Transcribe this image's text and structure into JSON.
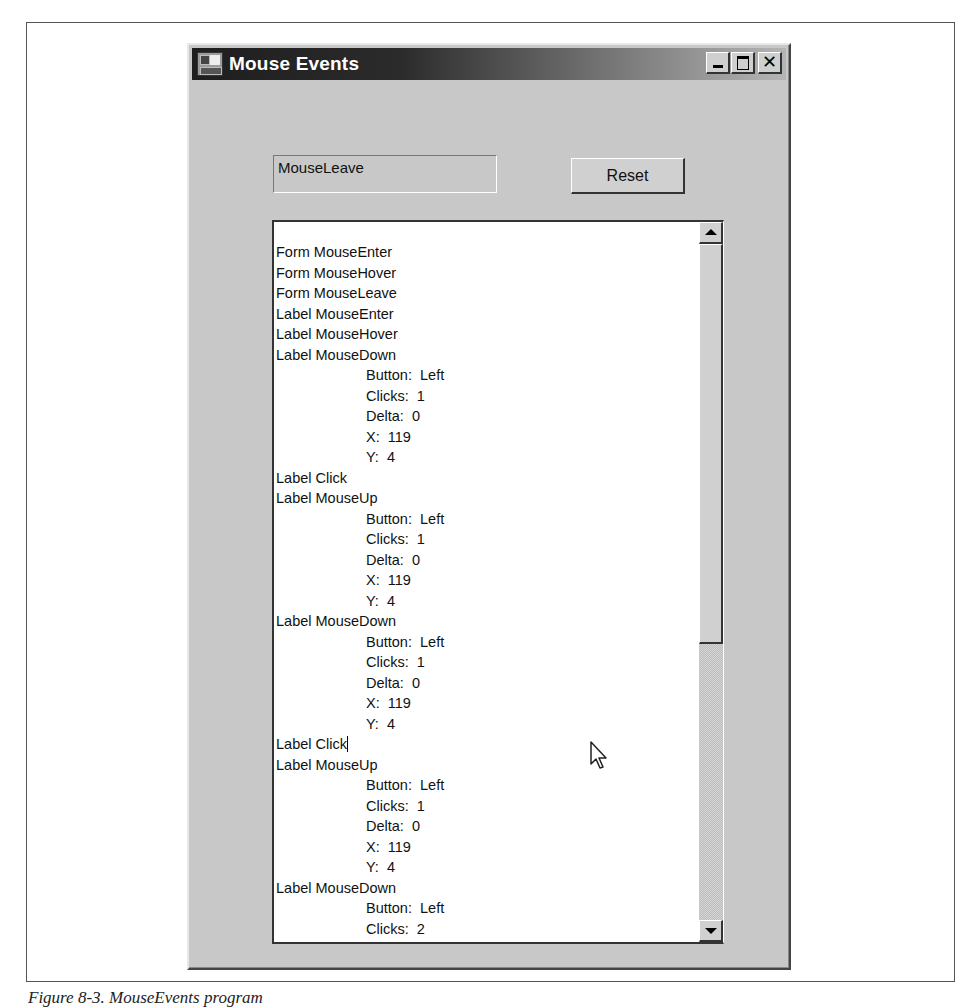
{
  "window": {
    "title": "Mouse Events",
    "app_icon": "form-window-icon",
    "title_buttons": {
      "minimize": "minimize-icon",
      "maximize": "maximize-icon",
      "close": "close-icon"
    }
  },
  "status_label": {
    "text": "MouseLeave"
  },
  "reset_button": {
    "label": "Reset"
  },
  "event_log": {
    "lines": [
      {
        "text": "Form MouseEnter",
        "indent": false
      },
      {
        "text": "Form MouseHover",
        "indent": false
      },
      {
        "text": "Form MouseLeave",
        "indent": false
      },
      {
        "text": "Label MouseEnter",
        "indent": false
      },
      {
        "text": "Label MouseHover",
        "indent": false
      },
      {
        "text": "Label MouseDown",
        "indent": false
      },
      {
        "text": "Button:  Left",
        "indent": true
      },
      {
        "text": "Clicks:  1",
        "indent": true
      },
      {
        "text": "Delta:  0",
        "indent": true
      },
      {
        "text": "X:  119",
        "indent": true
      },
      {
        "text": "Y:  4",
        "indent": true
      },
      {
        "text": "Label Click",
        "indent": false
      },
      {
        "text": "Label MouseUp",
        "indent": false
      },
      {
        "text": "Button:  Left",
        "indent": true
      },
      {
        "text": "Clicks:  1",
        "indent": true
      },
      {
        "text": "Delta:  0",
        "indent": true
      },
      {
        "text": "X:  119",
        "indent": true
      },
      {
        "text": "Y:  4",
        "indent": true
      },
      {
        "text": "Label MouseDown",
        "indent": false
      },
      {
        "text": "Button:  Left",
        "indent": true
      },
      {
        "text": "Clicks:  1",
        "indent": true
      },
      {
        "text": "Delta:  0",
        "indent": true
      },
      {
        "text": "X:  119",
        "indent": true
      },
      {
        "text": "Y:  4",
        "indent": true
      },
      {
        "text": "Label Click",
        "indent": false,
        "caret": true
      },
      {
        "text": "Label MouseUp",
        "indent": false
      },
      {
        "text": "Button:  Left",
        "indent": true
      },
      {
        "text": "Clicks:  1",
        "indent": true
      },
      {
        "text": "Delta:  0",
        "indent": true
      },
      {
        "text": "X:  119",
        "indent": true
      },
      {
        "text": "Y:  4",
        "indent": true
      },
      {
        "text": "Label MouseDown",
        "indent": false
      },
      {
        "text": "Button:  Left",
        "indent": true
      },
      {
        "text": "Clicks:  2",
        "indent": true
      },
      {
        "text": "Delta:  0",
        "indent": true
      }
    ]
  },
  "scrollbar": {
    "up_icon": "scroll-up-arrow-icon",
    "down_icon": "scroll-down-arrow-icon"
  },
  "cursor": {
    "icon": "mouse-pointer-icon"
  },
  "caption": {
    "text": "Figure 8-3. MouseEvents program"
  }
}
